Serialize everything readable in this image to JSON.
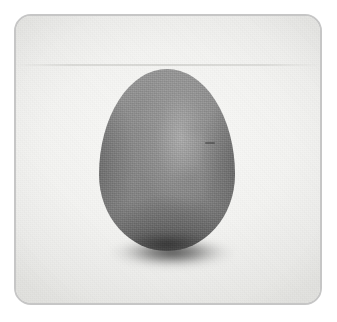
{
  "image": {
    "kind": "photograph",
    "subject": "egg-shaped gray stone",
    "alt_text": "A smooth, gray, egg-shaped stone standing upright on a pale off-white surface, photographed inside a rounded-corner frame.",
    "caption": "",
    "text_content": [],
    "dimensions": {
      "width_px": 337,
      "height_px": 322
    }
  },
  "frame": {
    "shape": "rounded-rectangle",
    "border_color": "#c6c6c6",
    "border_width_px": 2,
    "corner_radius_px": 17,
    "x_px": 14,
    "y_px": 14,
    "width_px": 308,
    "height_px": 291
  },
  "canvas": {
    "background_color": "#ffffff"
  },
  "backdrop": {
    "name": "pale paper surface",
    "color": "#f1f1ef",
    "highlight_color": "#fafaf8",
    "shade_color": "#e6e6e3",
    "texture": "fine paper grain",
    "seam_y_px": 62
  },
  "object": {
    "name": "stone",
    "silhouette": "egg / ovoid, narrower at top",
    "x_px": 97,
    "y_px": 67,
    "width_px": 136,
    "height_px": 182,
    "center_x_px": 165,
    "base_y_px": 249,
    "body_color": "#8b8b8b",
    "highlight_color": "#c4c4c4",
    "rim_shadow_color": "#3a3a3a",
    "base_shadow_color": "#2c2c2c",
    "surface": "matte, finely grained"
  },
  "shadow": {
    "name": "contact shadow",
    "color": "#262626",
    "x_px": 106,
    "y_px": 236,
    "width_px": 128,
    "height_px": 34,
    "blur_px": 3
  }
}
